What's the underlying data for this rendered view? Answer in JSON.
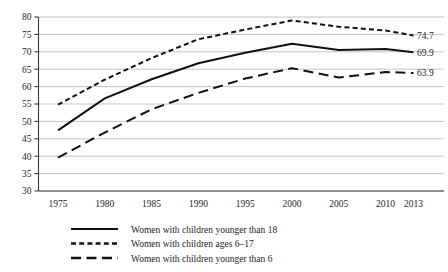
{
  "chart_data": {
    "type": "line",
    "title": "",
    "subtitle": "",
    "xlabel": "",
    "ylabel": "",
    "x": [
      1975,
      1980,
      1985,
      1990,
      1995,
      2000,
      2005,
      2010,
      2013
    ],
    "categories": [
      "1975",
      "1980",
      "1985",
      "1990",
      "1995",
      "2000",
      "2005",
      "2010",
      "2013"
    ],
    "xlim": [
      1975,
      2013
    ],
    "ylim": [
      30,
      80
    ],
    "yticks": [
      30,
      35,
      40,
      45,
      50,
      55,
      60,
      65,
      70,
      75,
      80
    ],
    "ytick_labels": [
      "30",
      "35",
      "40",
      "45",
      "50",
      "55",
      "60",
      "65",
      "70",
      "75",
      "80"
    ],
    "grid": true,
    "legend_position": "bottom-center",
    "series": [
      {
        "name": "Women with children younger than 18",
        "style": "solid",
        "color": "#111111",
        "values": [
          47.4,
          56.6,
          62.1,
          66.7,
          69.7,
          72.3,
          70.5,
          70.8,
          69.9
        ],
        "end_label": "69.9"
      },
      {
        "name": "Women with children ages 6–17",
        "style": "dotted",
        "color": "#111111",
        "values": [
          54.8,
          62.0,
          68.2,
          73.6,
          76.4,
          79.0,
          77.2,
          76.1,
          74.7
        ],
        "end_label": "74.7"
      },
      {
        "name": "Women with children younger than 6",
        "style": "dashed",
        "color": "#111111",
        "values": [
          39.6,
          46.8,
          53.5,
          58.2,
          62.3,
          65.3,
          62.6,
          64.2,
          63.9
        ],
        "end_label": "63.9"
      }
    ],
    "end_labels": [
      "74.7",
      "69.9",
      "63.9"
    ],
    "legend": [
      {
        "label": "Women with children younger than 18",
        "style": "solid"
      },
      {
        "label": "Women with children ages 6–17",
        "style": "dotted"
      },
      {
        "label": "Women with children younger than 6",
        "style": "dashed"
      }
    ]
  }
}
